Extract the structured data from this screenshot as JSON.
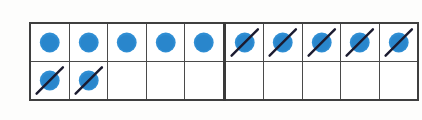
{
  "figure": {
    "background_color": "#fdfdfc",
    "counter_color": "#2f8ed4",
    "counter_shade_color": "#1f78bd",
    "cross_out_color": "#1b1b30",
    "grid_line_color": "#4a4a4a",
    "grid_outer_color": "#3f3f3f",
    "group_divider_color": "#3a3a3a",
    "columns": 10,
    "rows": 2,
    "group_divider_after_column": 5
  },
  "legend": {
    "dot_label": "counter",
    "crossed_dot_label": "crossed-out counter",
    "empty_label": "empty cell"
  },
  "counts": {
    "total_counters": 12,
    "plain_counters": 5,
    "crossed_out_counters": 7,
    "empty_cells": 8
  },
  "grid": {
    "rows": [
      {
        "row_label": "row-1",
        "cells": [
          {
            "state": "dot",
            "state_label": "counter"
          },
          {
            "state": "dot",
            "state_label": "counter"
          },
          {
            "state": "dot",
            "state_label": "counter"
          },
          {
            "state": "dot",
            "state_label": "counter"
          },
          {
            "state": "dot",
            "state_label": "counter"
          },
          {
            "state": "crossed",
            "state_label": "crossed-out counter"
          },
          {
            "state": "crossed",
            "state_label": "crossed-out counter"
          },
          {
            "state": "crossed",
            "state_label": "crossed-out counter"
          },
          {
            "state": "crossed",
            "state_label": "crossed-out counter"
          },
          {
            "state": "crossed",
            "state_label": "crossed-out counter"
          }
        ]
      },
      {
        "row_label": "row-2",
        "cells": [
          {
            "state": "crossed",
            "state_label": "crossed-out counter"
          },
          {
            "state": "crossed",
            "state_label": "crossed-out counter"
          },
          {
            "state": "empty",
            "state_label": "empty cell"
          },
          {
            "state": "empty",
            "state_label": "empty cell"
          },
          {
            "state": "empty",
            "state_label": "empty cell"
          },
          {
            "state": "empty",
            "state_label": "empty cell"
          },
          {
            "state": "empty",
            "state_label": "empty cell"
          },
          {
            "state": "empty",
            "state_label": "empty cell"
          },
          {
            "state": "empty",
            "state_label": "empty cell"
          },
          {
            "state": "empty",
            "state_label": "empty cell"
          }
        ]
      }
    ]
  }
}
